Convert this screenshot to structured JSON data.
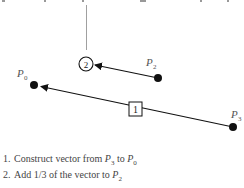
{
  "diagram": {
    "points": [
      {
        "id": "P0",
        "label": "P",
        "sub": "0",
        "x": 34,
        "y": 85
      },
      {
        "id": "P2",
        "label": "P",
        "sub": "2",
        "x": 158,
        "y": 78
      },
      {
        "id": "P3",
        "label": "P",
        "sub": "3",
        "x": 233,
        "y": 127
      }
    ],
    "markers": {
      "step1": {
        "shape": "square",
        "text": "1"
      },
      "step2": {
        "shape": "circle",
        "text": "2"
      }
    },
    "arrows": [
      {
        "from": "P3",
        "to": "P0",
        "marker": "1"
      },
      {
        "from": "P2",
        "to": "circle-2",
        "marker": "2"
      }
    ]
  },
  "steps": [
    {
      "num": "1.",
      "text_before": "Construct vector from ",
      "p_a": "P",
      "sub_a": "3",
      "text_mid": " to ",
      "p_b": "P",
      "sub_b": "0"
    },
    {
      "num": "2.",
      "text_before": "Add 1/3 of the vector to ",
      "p_a": "P",
      "sub_a": "2"
    }
  ]
}
